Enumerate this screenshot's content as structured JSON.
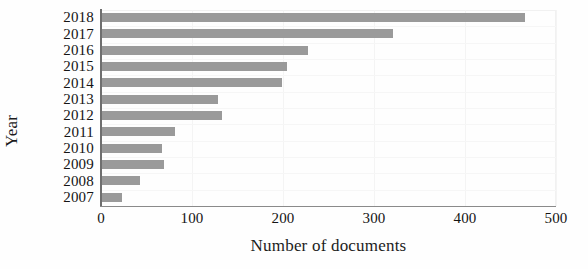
{
  "chart_data": {
    "type": "bar",
    "orientation": "horizontal",
    "title": "",
    "xlabel": "Number of documents",
    "ylabel": "Year",
    "categories": [
      "2018",
      "2017",
      "2016",
      "2015",
      "2014",
      "2013",
      "2012",
      "2011",
      "2010",
      "2009",
      "2008",
      "2007"
    ],
    "values": [
      466,
      321,
      228,
      204,
      199,
      129,
      133,
      81,
      67,
      69,
      43,
      23
    ],
    "xlim": [
      0,
      500
    ],
    "xticks": [
      0,
      100,
      200,
      300,
      400,
      500
    ],
    "xticklabels": [
      "0",
      "100",
      "200",
      "300",
      "400",
      "500"
    ],
    "grid": true,
    "legend": null,
    "bar_color": "#9a9a9a",
    "axis_color": "#6f6f6f",
    "background_color": "#fefefe",
    "series": [
      {
        "name": "Number of documents",
        "values": [
          466,
          321,
          228,
          204,
          199,
          129,
          133,
          81,
          67,
          69,
          43,
          23
        ]
      }
    ]
  }
}
